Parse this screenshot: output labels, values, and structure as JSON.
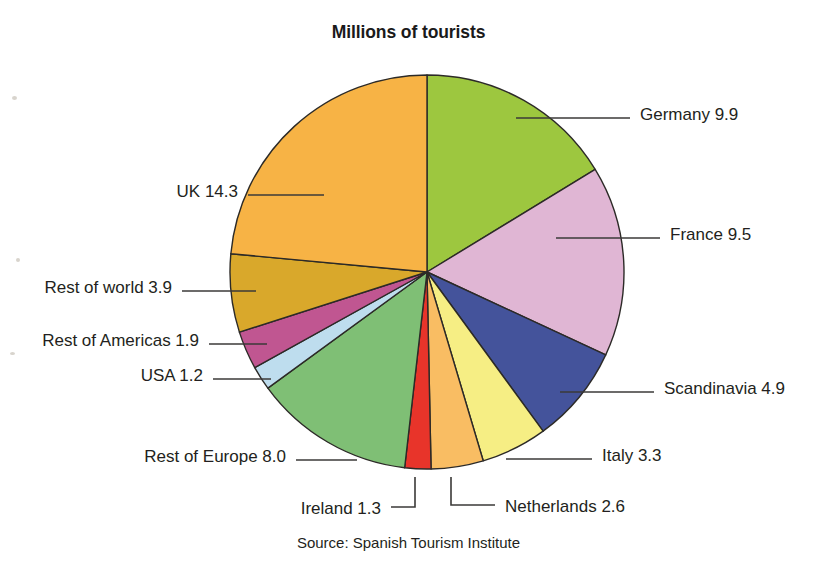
{
  "chart_data": {
    "type": "pie",
    "title": "Millions of tourists",
    "source": "Source: Spanish Tourism Institute",
    "unit": "millions of tourists",
    "total": 60.8,
    "start_angle_deg": 0,
    "direction": "clockwise",
    "legend": "none (direct labels with leader lines)",
    "grid": false,
    "categories": [
      "Germany",
      "France",
      "Scandinavia",
      "Italy",
      "Netherlands",
      "Ireland",
      "Rest of Europe",
      "USA",
      "Rest of Americas",
      "Rest of world",
      "UK"
    ],
    "values": [
      9.9,
      9.5,
      4.9,
      3.3,
      2.6,
      1.3,
      8.0,
      1.2,
      1.9,
      3.9,
      14.3
    ],
    "colors": [
      "#9DC73F",
      "#E0B6D4",
      "#44539B",
      "#F6EE84",
      "#F9BD63",
      "#E8342A",
      "#7FBF75",
      "#BEDDEE",
      "#C05691",
      "#D9A82B",
      "#F7B345"
    ],
    "slices": [
      {
        "label": "Germany",
        "value": 9.9,
        "text": "Germany 9.9",
        "color": "#9DC73F"
      },
      {
        "label": "France",
        "value": 9.5,
        "text": "France 9.5",
        "color": "#E0B6D4"
      },
      {
        "label": "Scandinavia",
        "value": 4.9,
        "text": "Scandinavia 4.9",
        "color": "#44539B"
      },
      {
        "label": "Italy",
        "value": 3.3,
        "text": "Italy 3.3",
        "color": "#F6EE84"
      },
      {
        "label": "Netherlands",
        "value": 2.6,
        "text": "Netherlands 2.6",
        "color": "#F9BD63"
      },
      {
        "label": "Ireland",
        "value": 1.3,
        "text": "Ireland 1.3",
        "color": "#E8342A"
      },
      {
        "label": "Rest of Europe",
        "value": 8.0,
        "text": "Rest of Europe 8.0",
        "color": "#7FBF75"
      },
      {
        "label": "USA",
        "value": 1.2,
        "text": "USA 1.2",
        "color": "#BEDDEE"
      },
      {
        "label": "Rest of Americas",
        "value": 1.9,
        "text": "Rest of Americas 1.9",
        "color": "#C05691"
      },
      {
        "label": "Rest of world",
        "value": 3.9,
        "text": "Rest of world 3.9",
        "color": "#D9A82B"
      },
      {
        "label": "UK",
        "value": 14.3,
        "text": "UK 14.3",
        "color": "#F7B345"
      }
    ]
  },
  "labels": {
    "germany": "Germany 9.9",
    "france": "France 9.5",
    "scandinavia": "Scandinavia 4.9",
    "italy": "Italy 3.3",
    "netherlands": "Netherlands 2.6",
    "ireland": "Ireland 1.3",
    "rest_of_europe": "Rest of Europe 8.0",
    "usa": "USA 1.2",
    "rest_of_americas": "Rest of Americas 1.9",
    "rest_of_world": "Rest of world 3.9",
    "uk": "UK 14.3"
  }
}
